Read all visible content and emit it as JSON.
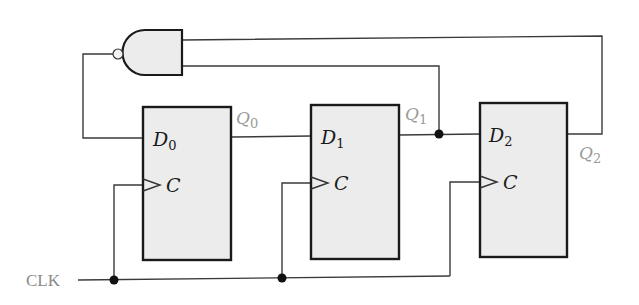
{
  "diagram": {
    "type": "synchronous counter (3 D flip-flops with NAND feedback)",
    "clock_label": "CLK",
    "gate": {
      "type": "NAND",
      "inputs": [
        "Q2",
        "Q1"
      ],
      "output_to": "D0"
    },
    "flip_flops": [
      {
        "d_label": "D",
        "d_sub": "0",
        "clk_label": "C",
        "q_label": "Q",
        "q_sub": "0"
      },
      {
        "d_label": "D",
        "d_sub": "1",
        "clk_label": "C",
        "q_label": "Q",
        "q_sub": "1"
      },
      {
        "d_label": "D",
        "d_sub": "2",
        "clk_label": "C",
        "q_label": "Q",
        "q_sub": "2"
      }
    ],
    "connections": [
      "CLK -> C of all flip-flops",
      "Q0 -> D1",
      "Q1 -> D2",
      "Q1 -> NAND input",
      "Q2 -> NAND input",
      "NAND output -> D0"
    ]
  }
}
